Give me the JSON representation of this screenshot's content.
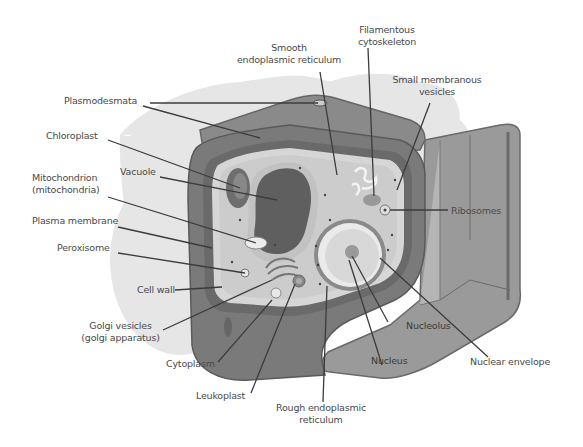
{
  "diagram": {
    "colors": {
      "background": "#ffffff",
      "shadow": "#e6e6e6",
      "cell_wall_outer": "#8a8a8a",
      "cell_wall_dark": "#6e6e6e",
      "cell_wall_light": "#a9a9a9",
      "membrane_light": "#d2d2d2",
      "cytoplasm": "#cfcfcf",
      "vacuole": "#5f5f5f",
      "nucleus": "#d9d9d9",
      "leader_line": "#3c3c3c",
      "label_text": "#4a4a4a"
    },
    "labels": {
      "smooth_er": [
        "Smooth",
        "endoplasmic reticulum"
      ],
      "filamentous": [
        "Filamentous",
        "cytoskeleton"
      ],
      "small_vesicles": [
        "Small membranous",
        "vesicles"
      ],
      "plasmodesmata": "Plasmodesmata",
      "chloroplast": "Chloroplast",
      "vacuole": "Vacuole",
      "mitochondrion": [
        "Mitochondrion",
        "(mitochondria)"
      ],
      "plasma_membrane": "Plasma membrane",
      "peroxisome": "Peroxisome",
      "cell_wall": "Cell wall",
      "golgi": [
        "Golgi vesicles",
        "(golgi apparatus)"
      ],
      "cytoplasm": "Cytoplasm",
      "leukoplast": "Leukoplast",
      "rough_er": [
        "Rough endoplasmic",
        "reticulum"
      ],
      "ribosomes": "Ribosomes",
      "nucleolus": "Nucleolus",
      "nucleus": "Nucleus",
      "nuclear_envelope": "Nuclear envelope"
    }
  }
}
